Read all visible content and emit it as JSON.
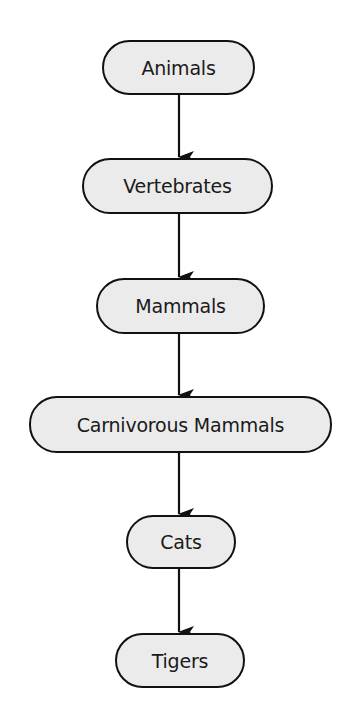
{
  "diagram": {
    "type": "flowchart",
    "direction": "top-to-bottom",
    "nodes": [
      {
        "id": "animals",
        "label": "Animals"
      },
      {
        "id": "vertebrates",
        "label": "Vertebrates"
      },
      {
        "id": "mammals",
        "label": "Mammals"
      },
      {
        "id": "carnivorous_mammals",
        "label": "Carnivorous Mammals"
      },
      {
        "id": "cats",
        "label": "Cats"
      },
      {
        "id": "tigers",
        "label": "Tigers"
      }
    ],
    "edges": [
      {
        "from": "animals",
        "to": "vertebrates"
      },
      {
        "from": "vertebrates",
        "to": "mammals"
      },
      {
        "from": "mammals",
        "to": "carnivorous_mammals"
      },
      {
        "from": "carnivorous_mammals",
        "to": "cats"
      },
      {
        "from": "cats",
        "to": "tigers"
      }
    ],
    "colors": {
      "node_fill": "#ebebeb",
      "node_border": "#111111",
      "edge": "#111111",
      "background": "#ffffff"
    }
  }
}
